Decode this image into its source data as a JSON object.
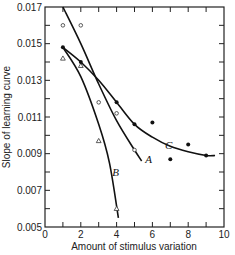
{
  "chart_data": {
    "type": "scatter",
    "title": "",
    "xlabel": "Amount of stimulus variation",
    "ylabel": "Slope of learning curve",
    "xlim": [
      0,
      10
    ],
    "ylim": [
      0.005,
      0.017
    ],
    "x_ticks": [
      0,
      2,
      4,
      6,
      8,
      10
    ],
    "x_minor_ticks": [
      1,
      3,
      5,
      7,
      9
    ],
    "y_ticks": [
      0.005,
      0.007,
      0.009,
      0.011,
      0.013,
      0.015,
      0.017
    ],
    "y_tick_labels": [
      "0.005",
      "0.007",
      "0.009",
      "0.011",
      "0.013",
      "0.015",
      "0.017"
    ],
    "y_minor_ticks": [
      0.006,
      0.008,
      0.01,
      0.012,
      0.014,
      0.016
    ],
    "grid": false,
    "legend": "none (curves labeled inline A, B, C)",
    "series": [
      {
        "name": "A",
        "marker": "open-circle",
        "points": [
          [
            1,
            0.016
          ],
          [
            2,
            0.016
          ],
          [
            3,
            0.0118
          ],
          [
            4,
            0.0112
          ],
          [
            5,
            0.0092
          ]
        ],
        "curve": [
          [
            1,
            0.017
          ],
          [
            2,
            0.015
          ],
          [
            3,
            0.0128
          ],
          [
            4,
            0.0108
          ],
          [
            5,
            0.0092
          ],
          [
            5.4,
            0.0086
          ]
        ],
        "label_pos": [
          5.6,
          0.0087
        ]
      },
      {
        "name": "B",
        "marker": "open-triangle",
        "points": [
          [
            1,
            0.0142
          ],
          [
            2,
            0.0138
          ],
          [
            3,
            0.0097
          ],
          [
            4,
            0.006
          ]
        ],
        "curve": [
          [
            1,
            0.0148
          ],
          [
            2,
            0.0132
          ],
          [
            3,
            0.0106
          ],
          [
            3.6,
            0.0085
          ],
          [
            4.1,
            0.0055
          ]
        ],
        "label_pos": [
          3.75,
          0.008
        ]
      },
      {
        "name": "C",
        "marker": "filled-circle",
        "points": [
          [
            1,
            0.0148
          ],
          [
            2,
            0.014
          ],
          [
            4,
            0.0118
          ],
          [
            5,
            0.0106
          ],
          [
            6,
            0.0107
          ],
          [
            7,
            0.0087
          ],
          [
            8,
            0.0095
          ],
          [
            9,
            0.0089
          ]
        ],
        "curve": [
          [
            1,
            0.0148
          ],
          [
            2,
            0.014
          ],
          [
            3,
            0.013
          ],
          [
            4,
            0.0118
          ],
          [
            5,
            0.0106
          ],
          [
            6,
            0.0099
          ],
          [
            7,
            0.0094
          ],
          [
            8,
            0.0091
          ],
          [
            9,
            0.0089
          ],
          [
            9.5,
            0.0089
          ]
        ],
        "label_pos": [
          6.7,
          0.0095
        ]
      }
    ]
  }
}
